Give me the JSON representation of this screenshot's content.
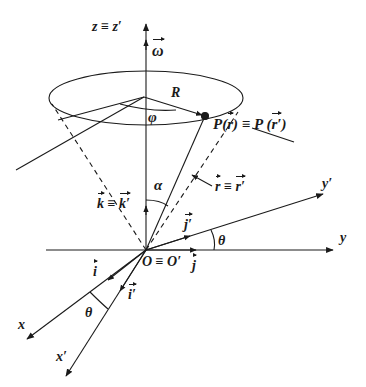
{
  "diagram": {
    "labels": {
      "z_axis": "z ≡ z′",
      "omega": "ω",
      "radius": "R",
      "phi": "φ",
      "point_p_left": "P(",
      "point_p_r": "r",
      "point_p_mid": ") ≡ P (",
      "point_p_rprime": "r′",
      "point_p_end": ")",
      "alpha": "α",
      "r_vec_r": "r",
      "r_vec_eq": " ≡ ",
      "r_vec_rprime": "r′",
      "k_vec": "k",
      "k_eq": " ≡ ",
      "k_prime_vec": "k′",
      "y_prime_axis": "y′",
      "j_prime": "j′",
      "theta_top": "θ",
      "y_axis": "y",
      "origin": "O ≡ O′",
      "j": "j",
      "i": "i",
      "i_prime": "i′",
      "theta_bottom": "θ",
      "x_axis": "x",
      "x_prime_axis": "x′"
    },
    "colors": {
      "ink": "#1a1a1a",
      "background": "#ffffff"
    },
    "geometry": {
      "origin": [
        146,
        250
      ],
      "circle_center": [
        144,
        97
      ],
      "point_P": [
        205,
        116
      ]
    }
  }
}
